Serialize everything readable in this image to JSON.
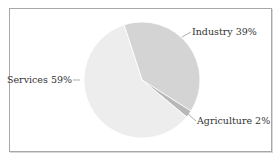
{
  "chart_data": {
    "type": "pie",
    "title": "",
    "categories": [
      "Industry",
      "Agriculture",
      "Services"
    ],
    "values": [
      39,
      2,
      59
    ],
    "labels": [
      "Industry 39%",
      "Agriculture 2%",
      "Services 59%"
    ],
    "colors": [
      "#d4d4d4",
      "#b8b8b8",
      "#ededed"
    ],
    "start_angle_deg": -108,
    "direction": "clockwise",
    "legend": "none",
    "label_style": "outside with leader lines"
  },
  "labels": {
    "industry": "Industry 39%",
    "agriculture": "Agriculture 2%",
    "services": "Services 59%"
  }
}
